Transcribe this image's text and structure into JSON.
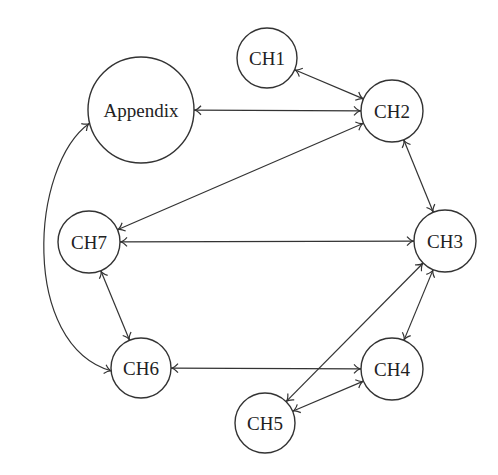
{
  "diagram": {
    "type": "graph",
    "directed": "bidirectional",
    "nodes": [
      {
        "id": "appendix",
        "label": "Appendix",
        "x": 141,
        "y": 110,
        "r": 53
      },
      {
        "id": "ch1",
        "label": "CH1",
        "x": 267,
        "y": 58,
        "r": 30
      },
      {
        "id": "ch2",
        "label": "CH2",
        "x": 392,
        "y": 111,
        "r": 31
      },
      {
        "id": "ch3",
        "label": "CH3",
        "x": 445,
        "y": 241,
        "r": 31
      },
      {
        "id": "ch4",
        "label": "CH4",
        "x": 392,
        "y": 369,
        "r": 31
      },
      {
        "id": "ch5",
        "label": "CH5",
        "x": 265,
        "y": 423,
        "r": 30
      },
      {
        "id": "ch6",
        "label": "CH6",
        "x": 141,
        "y": 368,
        "r": 30
      },
      {
        "id": "ch7",
        "label": "CH7",
        "x": 89,
        "y": 242,
        "r": 31
      }
    ],
    "edges": [
      {
        "from": "ch1",
        "to": "ch2",
        "bidirectional": true
      },
      {
        "from": "appendix",
        "to": "ch2",
        "bidirectional": true
      },
      {
        "from": "ch7",
        "to": "ch2",
        "bidirectional": true
      },
      {
        "from": "ch2",
        "to": "ch3",
        "bidirectional": true
      },
      {
        "from": "ch7",
        "to": "ch3",
        "bidirectional": true
      },
      {
        "from": "ch3",
        "to": "ch4",
        "bidirectional": true
      },
      {
        "from": "ch3",
        "to": "ch5",
        "bidirectional": true
      },
      {
        "from": "ch4",
        "to": "ch5",
        "bidirectional": true
      },
      {
        "from": "ch6",
        "to": "ch4",
        "bidirectional": true
      },
      {
        "from": "ch7",
        "to": "ch6",
        "bidirectional": true
      },
      {
        "from": "appendix",
        "to": "ch6",
        "bidirectional": true,
        "curved": true
      }
    ]
  }
}
